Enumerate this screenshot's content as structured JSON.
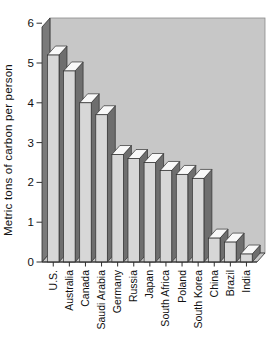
{
  "chart_data": {
    "type": "bar",
    "style": "3d-column",
    "title": "",
    "xlabel": "",
    "ylabel": "Metric tons of carbon per person",
    "categories": [
      "U.S.",
      "Australia",
      "Canada",
      "Saudi Arabia",
      "Germany",
      "Russia",
      "Japan",
      "South Africa",
      "Poland",
      "South Korea",
      "China",
      "Brazil",
      "India"
    ],
    "values": [
      5.2,
      4.8,
      4.0,
      3.7,
      2.7,
      2.6,
      2.5,
      2.3,
      2.2,
      2.1,
      0.6,
      0.5,
      0.2
    ],
    "ylim": [
      0,
      6
    ],
    "yticks": [
      0,
      1,
      2,
      3,
      4,
      5,
      6
    ],
    "grid": false,
    "legend": null,
    "colors": {
      "background": "#ffffff",
      "wall_back": "#c7c7c7",
      "wall_left": "#7a7a7a",
      "floor": "#c7c7c7",
      "bar_front": "#d7d7d7",
      "bar_top": "#f9f9f9",
      "bar_side": "#6e6e6e",
      "outline": "#2f2f2f",
      "text": "#111111"
    }
  }
}
